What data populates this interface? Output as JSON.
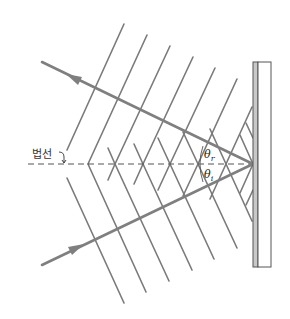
{
  "diagram": {
    "labels": {
      "normal": "법선",
      "theta_reflected": "θ",
      "theta_reflected_sub": "r",
      "theta_incident": "θ",
      "theta_incident_sub": "i"
    },
    "colors": {
      "line": "#7a7a7a",
      "ray": "#7f7f7f",
      "mirror_fill": "#c8c8c8",
      "mirror_stroke": "#555555",
      "background": "#ffffff"
    },
    "mirror": {
      "x": 253,
      "y_top": 62,
      "y_bottom": 267,
      "strip_width": 5,
      "box_width": 13
    },
    "normal_line": {
      "y": 164,
      "x_start": 28,
      "x_end": 253,
      "style": "dashed"
    },
    "incident_ray": {
      "from": [
        42,
        265
      ],
      "to": [
        253,
        164
      ],
      "arrow_at": [
        75,
        249
      ]
    },
    "reflected_ray": {
      "from": [
        253,
        164
      ],
      "to": [
        42,
        62
      ],
      "arrow_at": [
        75,
        78
      ]
    }
  }
}
